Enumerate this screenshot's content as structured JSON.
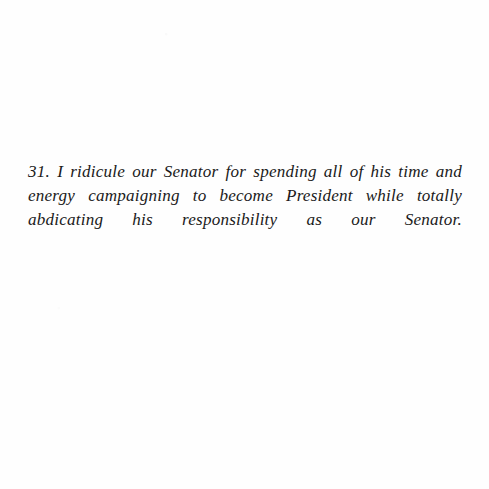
{
  "page": {
    "background_color": "#fefefe",
    "ink_color": "#1a1a1a",
    "width": 489,
    "height": 489
  },
  "content": {
    "item_number": "31.",
    "paragraph_text": "31. I ridicule our Senator for spending all of his time and energy campaigning to become President while totally abdicating his responsibility as our Senator.",
    "lines": [
      "31. I ridicule our Senator for spending all of his time and energy",
      "campaigning to become President while totally abdicating his",
      "responsibility as our Senator."
    ]
  }
}
